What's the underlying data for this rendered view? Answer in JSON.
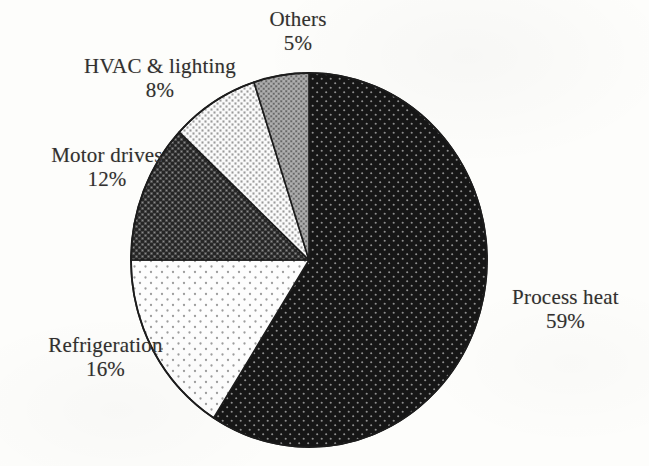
{
  "chart_data": {
    "type": "pie",
    "title": "",
    "subtitle": "",
    "xlabel": "",
    "ylabel": "",
    "legend_position": "none",
    "grid": false,
    "units": "percent",
    "start_angle_deg": 0,
    "direction": "clockwise",
    "total": 100,
    "categories": [
      "Process heat",
      "Refrigeration",
      "Motor drives",
      "HVAC & lighting",
      "Others"
    ],
    "values": [
      59,
      16,
      12,
      8,
      5
    ],
    "slices": [
      {
        "label": "Process heat",
        "value": 59,
        "value_text": "59%",
        "fill": "#141414",
        "pattern": "dark-fine-dot",
        "dot_color": "#8d8d8d",
        "start_deg": 0,
        "end_deg": 212.4
      },
      {
        "label": "Refrigeration",
        "value": 16,
        "value_text": "16%",
        "fill": "#fdfdfd",
        "pattern": "sparse-dot",
        "dot_color": "#9a9a9a",
        "start_deg": 212.4,
        "end_deg": 270
      },
      {
        "label": "Motor drives",
        "value": 12,
        "value_text": "12%",
        "fill": "#2f2f2f",
        "pattern": "dark-checker",
        "dot_color": "#7a7a7a",
        "start_deg": 270,
        "end_deg": 313.2
      },
      {
        "label": "HVAC & lighting",
        "value": 8,
        "value_text": "8%",
        "fill": "#f2f2f2",
        "pattern": "light-checker",
        "dot_color": "#8f8f8f",
        "start_deg": 313.2,
        "end_deg": 342
      },
      {
        "label": "Others",
        "value": 5,
        "value_text": "5%",
        "fill": "#9b9b9b",
        "pattern": "mid-checker",
        "dot_color": "#5a5a5a",
        "start_deg": 342,
        "end_deg": 360
      }
    ],
    "geometry": {
      "center_x": 309,
      "center_y": 260,
      "radius_x": 178,
      "radius_y": 187,
      "outline_color": "#1c1c1c"
    }
  },
  "labels": {
    "process_heat": {
      "name": "Process heat",
      "pct": "59%"
    },
    "refrigeration": {
      "name": "Refrigeration",
      "pct": "16%"
    },
    "motor_drives": {
      "name": "Motor drives",
      "pct": "12%"
    },
    "hvac_lighting": {
      "name": "HVAC & lighting",
      "pct": "8%"
    },
    "others": {
      "name": "Others",
      "pct": "5%"
    }
  },
  "page": {
    "background": "#fdfdfb",
    "text_color": "#32302f"
  }
}
